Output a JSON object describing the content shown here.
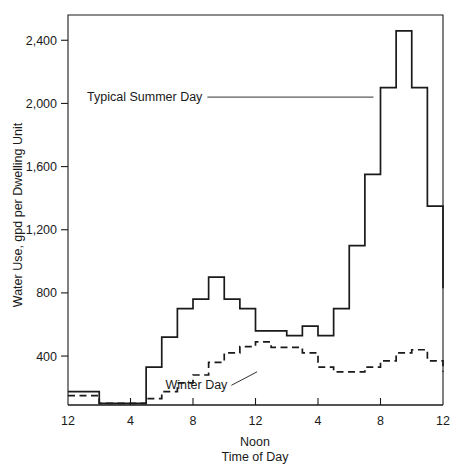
{
  "chart_data": {
    "type": "line",
    "title": "",
    "subtitle": "",
    "xlabel": "Time of Day",
    "xlabel_secondary": "Noon",
    "ylabel": "Water Use, gpd per Dwelling Unit",
    "xlim": [
      0,
      24
    ],
    "ylim": [
      90,
      2560
    ],
    "grid": false,
    "legend_position": "inline-annotation",
    "xtick_positions": [
      0,
      4,
      8,
      12,
      16,
      20,
      24
    ],
    "xtick_labels": [
      "12",
      "4",
      "8",
      "12",
      "4",
      "8",
      "12"
    ],
    "ytick_values": [
      400,
      800,
      1200,
      1600,
      2000,
      2400
    ],
    "ytick_labels": [
      "400",
      "800",
      "1,200",
      "1,600",
      "2,000",
      "2,400"
    ],
    "line_color": "#1a1a1a",
    "step_type": "post",
    "x_hours": [
      0,
      1,
      2,
      3,
      4,
      5,
      6,
      7,
      8,
      9,
      10,
      11,
      12,
      13,
      14,
      15,
      16,
      17,
      18,
      19,
      20,
      21,
      22,
      23,
      24
    ],
    "series": [
      {
        "name": "Typical Summer Day",
        "style": "solid",
        "label_x_hour": 8.6,
        "label_y_value": 2040,
        "values": [
          175,
          175,
          100,
          100,
          100,
          330,
          520,
          700,
          760,
          900,
          760,
          700,
          560,
          560,
          530,
          590,
          530,
          700,
          1100,
          1550,
          2100,
          2460,
          2100,
          1350,
          830,
          460
        ]
      },
      {
        "name": "Winter Day",
        "style": "dashed",
        "label_x_hour": 10.2,
        "label_y_value": 215,
        "values": [
          150,
          150,
          100,
          100,
          100,
          130,
          175,
          230,
          280,
          360,
          420,
          460,
          490,
          455,
          455,
          420,
          330,
          300,
          300,
          330,
          370,
          420,
          440,
          370,
          300,
          300
        ]
      }
    ],
    "annotations": [
      {
        "text": "Typical Summer Day",
        "leader": true
      },
      {
        "text": "Winter Day",
        "leader": true
      }
    ]
  }
}
